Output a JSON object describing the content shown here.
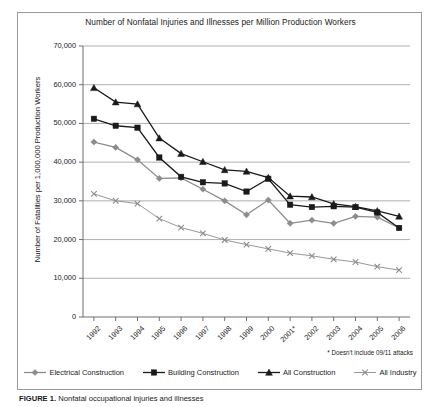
{
  "chart_data": {
    "type": "line",
    "title": "Number of Nonfatal Injuries and Illnesses per Million Production Workers",
    "xlabel": "",
    "ylabel": "Number of Fatalities per 1,000,000 Production Workers",
    "x": [
      "1992",
      "1993",
      "1994",
      "1995",
      "1996",
      "1997",
      "1998",
      "1999",
      "2000",
      "2001*",
      "2002",
      "2003",
      "2004",
      "2005",
      "2006"
    ],
    "xtick_labels": [
      "1992",
      "1993",
      "1994",
      "1995",
      "1996",
      "1997",
      "1998",
      "1999",
      "2000",
      "2001*",
      "2002",
      "2003",
      "2004",
      "2005",
      "2006"
    ],
    "ytick_labels": [
      "0",
      "10,000",
      "20,000",
      "30,000",
      "40,000",
      "50,000",
      "60,000",
      "70,000"
    ],
    "ytick_values": [
      0,
      10000,
      20000,
      30000,
      40000,
      50000,
      60000,
      70000
    ],
    "ylim": [
      0,
      70000
    ],
    "grid": true,
    "legend_position": "bottom",
    "footnote": "* Doesn't include 09/11 attacks",
    "series": [
      {
        "name": "Electrical Construction",
        "marker": "diamond",
        "color": "#8c8c8c",
        "values": [
          45200,
          43800,
          40600,
          35800,
          35900,
          33000,
          30000,
          26400,
          30200,
          24200,
          25000,
          24200,
          26000,
          25800,
          23000
        ]
      },
      {
        "name": "Building Construction",
        "marker": "square",
        "color": "#1a1a1a",
        "values": [
          51200,
          49400,
          48900,
          41200,
          36200,
          34800,
          34500,
          32400,
          35700,
          29000,
          28400,
          28600,
          28400,
          27000,
          23000
        ]
      },
      {
        "name": "All Construction",
        "marker": "triangle",
        "color": "#1a1a1a",
        "values": [
          59200,
          55500,
          55000,
          46200,
          42200,
          40100,
          38000,
          37600,
          36000,
          31200,
          31000,
          29200,
          28500,
          27400,
          26000
        ]
      },
      {
        "name": "All Industry",
        "marker": "x",
        "color": "#8c8c8c",
        "values": [
          31800,
          30000,
          29300,
          25400,
          23100,
          21600,
          19900,
          18700,
          17600,
          16500,
          15800,
          14900,
          14200,
          13000,
          12100
        ]
      }
    ]
  },
  "caption": {
    "label": "FIGURE 1.",
    "text": "Nonfatal occupational injuries and illnesses"
  }
}
